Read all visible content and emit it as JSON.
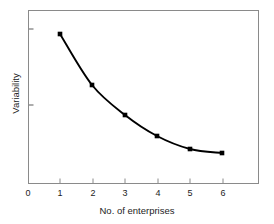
{
  "chart_data": {
    "type": "line",
    "title": "",
    "subtitle": "",
    "xlabel": "No. of enterprises",
    "ylabel": "Variability",
    "x": [
      1,
      2,
      3,
      4,
      5,
      6
    ],
    "values": [
      0.86,
      0.57,
      0.4,
      0.28,
      0.2,
      0.18
    ],
    "series": [
      {
        "name": "Variability",
        "x": [
          1,
          2,
          3,
          4,
          5,
          6
        ],
        "values": [
          0.86,
          0.57,
          0.4,
          0.28,
          0.2,
          0.18
        ]
      }
    ],
    "xtick_labels": [
      "0",
      "1",
      "2",
      "3",
      "4",
      "5",
      "6"
    ],
    "xticks": [
      0,
      1,
      2,
      3,
      4,
      5,
      6
    ],
    "ytick_labels": [
      "",
      ""
    ],
    "yticks": [
      0.89,
      0.45
    ],
    "xlim": [
      0,
      7
    ],
    "ylim": [
      0,
      1
    ],
    "grid": false,
    "legend": false,
    "legend_position": "none",
    "marker": "square",
    "line_color": "#000000",
    "marker_color": "#000000",
    "frame_color": "#8a8a8a",
    "background": "#ffffff",
    "annotations": []
  },
  "axes": {
    "x": {
      "title": "No. of enterprises",
      "ticks": [
        {
          "label": "0",
          "px": 28
        },
        {
          "label": "1",
          "px": 60
        },
        {
          "label": "2",
          "px": 93
        },
        {
          "label": "3",
          "px": 125
        },
        {
          "label": "4",
          "px": 158
        },
        {
          "label": "5",
          "px": 190
        },
        {
          "label": "6",
          "px": 223
        }
      ]
    },
    "y": {
      "title": "Variability",
      "ticks": [
        {
          "label": "",
          "px": 29
        },
        {
          "label": "",
          "px": 105
        }
      ]
    }
  },
  "points": [
    {
      "x": 1,
      "px": 60,
      "py": 34
    },
    {
      "x": 2,
      "px": 92,
      "py": 85
    },
    {
      "x": 3,
      "px": 125,
      "py": 115
    },
    {
      "x": 4,
      "px": 157,
      "py": 136
    },
    {
      "x": 5,
      "px": 190,
      "py": 149
    },
    {
      "x": 6,
      "px": 222,
      "py": 153
    }
  ]
}
